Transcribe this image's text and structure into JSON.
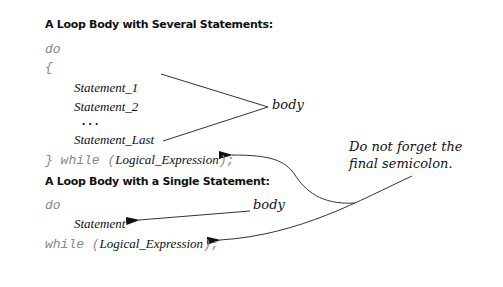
{
  "section1": {
    "title": "A Loop Body with Several Statements:",
    "do_kw": "do",
    "open_brace": "{",
    "statements": [
      "Statement_1",
      "Statement_2",
      ". . .",
      "Statement_Last"
    ],
    "close_prefix": "} while (",
    "condition": "Logical_Expression",
    "close_suffix": ");",
    "body_label": "body"
  },
  "section2": {
    "title": "A Loop Body with a Single Statement:",
    "do_kw": "do",
    "statement": "Statement",
    "while_prefix": "while (",
    "condition": "Logical_Expression",
    "while_suffix": ");",
    "body_label": "body"
  },
  "annotation": {
    "line1": "Do not forget the",
    "line2": "final semicolon."
  }
}
